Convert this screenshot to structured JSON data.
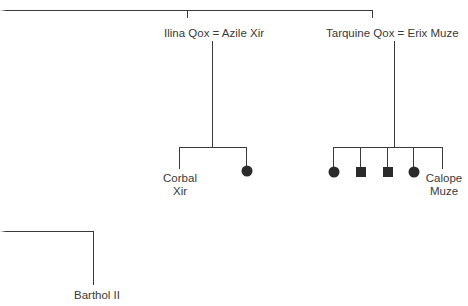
{
  "diagram": {
    "type": "family-tree",
    "couples": [
      {
        "id": "couple-1",
        "label": "Ilina Qox = Azile Xir"
      },
      {
        "id": "couple-2",
        "label": "Tarquine Qox = Erix Muze"
      }
    ],
    "children_couple_1": [
      {
        "kind": "named",
        "label_line1": "Corbal",
        "label_line2": "Xir"
      },
      {
        "kind": "female-symbol"
      }
    ],
    "children_couple_2": [
      {
        "kind": "female-symbol"
      },
      {
        "kind": "male-symbol"
      },
      {
        "kind": "male-symbol"
      },
      {
        "kind": "female-symbol"
      },
      {
        "kind": "named",
        "label_line1": "Calope",
        "label_line2": "Muze"
      }
    ],
    "lower_branch": {
      "label": "Barthol II"
    },
    "colors": {
      "line": "#3a3a3a",
      "symbol": "#2b2b2b",
      "background": "#ffffff"
    }
  }
}
